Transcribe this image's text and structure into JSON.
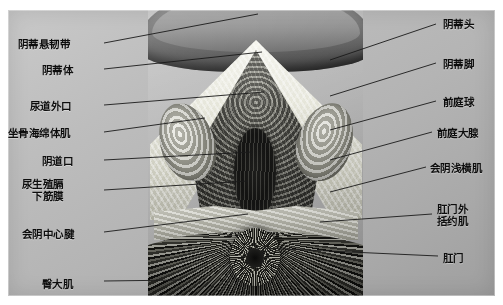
{
  "figure": {
    "image_kind": "anatomical-cross-section-photograph",
    "background_color": "#b8b8b8",
    "leader_line_color": "#1a1a1a",
    "label_color": "#0d0d0d"
  },
  "labels_left": [
    {
      "text": "阴蒂悬韧带",
      "x": 18,
      "y": 38,
      "anchor_x": 104,
      "anchor_y": 43,
      "target_x": 258,
      "target_y": 14
    },
    {
      "text": "阴蒂体",
      "x": 42,
      "y": 64,
      "anchor_x": 104,
      "anchor_y": 69,
      "target_x": 262,
      "target_y": 52
    },
    {
      "text": "尿道外口",
      "x": 30,
      "y": 100,
      "anchor_x": 104,
      "anchor_y": 105,
      "target_x": 264,
      "target_y": 92
    },
    {
      "text": "坐骨海绵体肌",
      "x": 8,
      "y": 127,
      "anchor_x": 104,
      "anchor_y": 132,
      "target_x": 205,
      "target_y": 118
    },
    {
      "text": "阴道口",
      "x": 42,
      "y": 155,
      "anchor_x": 104,
      "anchor_y": 160,
      "target_x": 252,
      "target_y": 152
    },
    {
      "text": "会阴中心腱",
      "x": 22,
      "y": 228,
      "anchor_x": 104,
      "anchor_y": 232,
      "target_x": 248,
      "target_y": 214
    },
    {
      "text": "臀大肌",
      "x": 42,
      "y": 278,
      "anchor_x": 104,
      "anchor_y": 281,
      "target_x": 182,
      "target_y": 280
    }
  ],
  "labels_left_multiline": [
    {
      "line1": "尿生殖膈",
      "line2": "下筋膜",
      "x": 22,
      "y": 178,
      "anchor_x": 104,
      "anchor_y": 190,
      "target_x": 248,
      "target_y": 181
    }
  ],
  "labels_right": [
    {
      "text": "阴蒂头",
      "x": 443,
      "y": 18,
      "anchor_x": 436,
      "anchor_y": 24,
      "target_x": 330,
      "target_y": 60
    },
    {
      "text": "阴蒂脚",
      "x": 443,
      "y": 58,
      "anchor_x": 436,
      "anchor_y": 63,
      "target_x": 330,
      "target_y": 96
    },
    {
      "text": "前庭球",
      "x": 443,
      "y": 96,
      "anchor_x": 436,
      "anchor_y": 101,
      "target_x": 330,
      "target_y": 130
    },
    {
      "text": "前庭大腺",
      "x": 437,
      "y": 127,
      "anchor_x": 432,
      "anchor_y": 132,
      "target_x": 330,
      "target_y": 160
    },
    {
      "text": "会阴浅横肌",
      "x": 430,
      "y": 162,
      "anchor_x": 426,
      "anchor_y": 167,
      "target_x": 330,
      "target_y": 192
    },
    {
      "text": "肛门",
      "x": 443,
      "y": 252,
      "anchor_x": 438,
      "anchor_y": 256,
      "target_x": 262,
      "target_y": 248
    }
  ],
  "labels_right_multiline": [
    {
      "line1": "肛门外",
      "line2": "括约肌",
      "x": 437,
      "y": 203,
      "anchor_x": 432,
      "anchor_y": 214,
      "target_x": 320,
      "target_y": 222
    }
  ],
  "structures": [
    "阴蒂悬韧带",
    "阴蒂体",
    "阴蒂头",
    "阴蒂脚",
    "尿道外口",
    "阴道口",
    "坐骨海绵体肌",
    "前庭球",
    "前庭大腺",
    "尿生殖膈下筋膜",
    "会阴浅横肌",
    "会阴中心腱",
    "肛门外括约肌",
    "肛门",
    "臀大肌"
  ]
}
